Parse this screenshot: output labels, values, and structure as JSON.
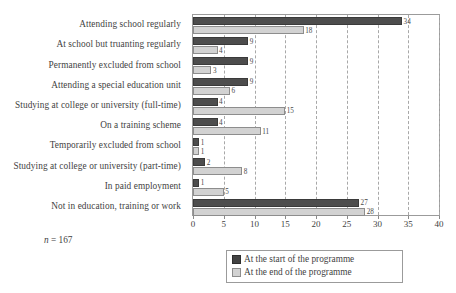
{
  "chart_data": {
    "type": "bar",
    "orientation": "horizontal",
    "title": "",
    "xlabel": "",
    "ylabel": "",
    "xlim": [
      0,
      40
    ],
    "xticks": [
      0,
      5,
      10,
      15,
      20,
      25,
      30,
      35,
      40
    ],
    "grid": true,
    "legend_position": "bottom-right",
    "categories": [
      "Attending school regularly",
      "At school but truanting regularly",
      "Permanently excluded from school",
      "Attending a special education unit",
      "Studying at college or university (full-time)",
      "On a training scheme",
      "Temporarily excluded from school",
      "Studying at college or university (part-time)",
      "In paid employment",
      "Not in education, training or work"
    ],
    "series": [
      {
        "name": "At the start of the programme",
        "color": "#4d4d4d",
        "values": [
          34,
          9,
          9,
          9,
          4,
          4,
          1,
          2,
          1,
          27
        ]
      },
      {
        "name": "At the end of the programme",
        "color": "#d2d2d2",
        "values": [
          18,
          4,
          3,
          6,
          15,
          11,
          1,
          8,
          5,
          28
        ]
      }
    ],
    "annotations": {
      "sample_size": "n = 167",
      "sample_size_italic_prefix": "n",
      "sample_size_rest": " = 167"
    }
  },
  "legend": {
    "items": [
      {
        "label": "At the start of the programme",
        "swatch": "dark-swatch-icon"
      },
      {
        "label": "At the end of the programme",
        "swatch": "light-swatch-icon"
      }
    ]
  }
}
